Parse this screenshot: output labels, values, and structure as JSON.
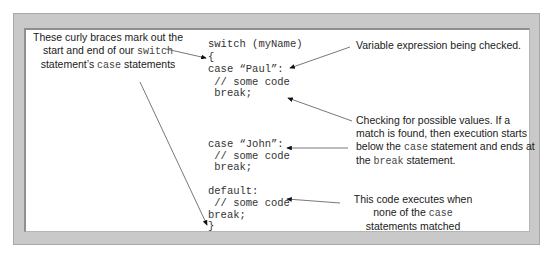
{
  "code_lines": [
    {
      "text": "switch (myName)",
      "y": 38
    },
    {
      "text": "{",
      "y": 51
    },
    {
      "text": "case “Paul”:",
      "y": 63
    },
    {
      "text": " // some code",
      "y": 76
    },
    {
      "text": " break;",
      "y": 87
    },
    {
      "text": "case “John”:",
      "y": 138
    },
    {
      "text": " // some code",
      "y": 150
    },
    {
      "text": " break;",
      "y": 161
    },
    {
      "text": "default:",
      "y": 185
    },
    {
      "text": " // some code",
      "y": 197
    },
    {
      "text": "break;",
      "y": 209
    },
    {
      "text": "}",
      "y": 220
    }
  ],
  "annotations": {
    "braces": {
      "pre1": "These curly braces mark out the",
      "pre2": "start and end of our ",
      "code1": "switch",
      "pre3": "statement’s ",
      "code2": "case",
      "post3": " statements"
    },
    "variable": "Variable expression being checked.",
    "checking": {
      "l1": "Checking for possible values. If a",
      "l2": "match is found, then execution starts",
      "l3a": "below the ",
      "l3code": "case",
      "l3b": " statement and ends at",
      "l4a": "the ",
      "l4code": "break",
      "l4b": " statement."
    },
    "default": {
      "l1": "This code executes when",
      "l2a": "none of the ",
      "l2code": "case",
      "l3": "statements matched"
    }
  }
}
